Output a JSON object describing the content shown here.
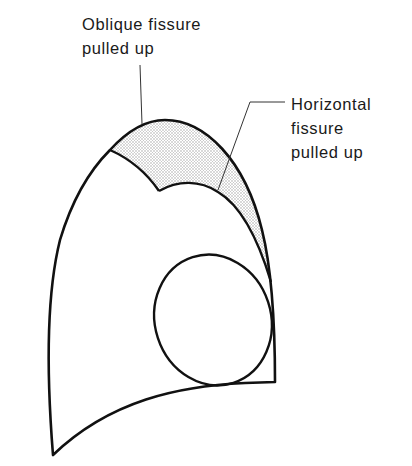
{
  "diagram": {
    "type": "anatomical line drawing",
    "colors": {
      "stroke": "#111111",
      "shading": "#d9d9d9",
      "background": "#ffffff"
    },
    "labels": {
      "oblique": {
        "line1": "Oblique fissure",
        "line2": "pulled up"
      },
      "horizontal": {
        "line1": "Horizontal",
        "line2": "fissure",
        "line3": "pulled up"
      }
    }
  }
}
